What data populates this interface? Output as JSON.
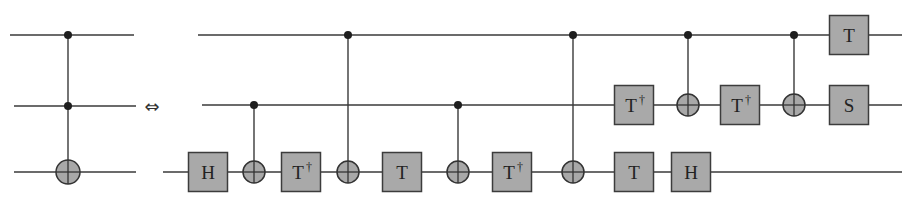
{
  "figure": {
    "equivalence_symbol": "⇔",
    "colors": {
      "gate_fill": "#a9a9a9",
      "wire": "#3a3a3a",
      "background": "#ffffff"
    }
  },
  "left_circuit": {
    "name": "Toffoli gate",
    "wires": [
      {
        "y": 35,
        "x1": 10,
        "x2": 134
      },
      {
        "y": 106,
        "x1": 14,
        "x2": 136
      },
      {
        "y": 172,
        "x1": 14,
        "x2": 136
      }
    ],
    "ops": [
      {
        "type": "ccnot",
        "x": 68,
        "controls": [
          0,
          1
        ],
        "target": 2
      }
    ]
  },
  "right_circuit": {
    "name": "Toffoli decomposition",
    "wires": [
      {
        "y": 35,
        "x1": 198,
        "x2": 902
      },
      {
        "y": 105,
        "x1": 202,
        "x2": 902
      },
      {
        "y": 172,
        "x1": 163,
        "x2": 902
      }
    ],
    "gates": [
      {
        "label": "H",
        "dagger": false,
        "x": 208,
        "wire": 2
      },
      {
        "label": "T",
        "dagger": true,
        "x": 301,
        "wire": 2
      },
      {
        "label": "T",
        "dagger": false,
        "x": 402,
        "wire": 2
      },
      {
        "label": "T",
        "dagger": true,
        "x": 512,
        "wire": 2
      },
      {
        "label": "T",
        "dagger": true,
        "x": 634,
        "wire": 1
      },
      {
        "label": "T",
        "dagger": false,
        "x": 634,
        "wire": 2
      },
      {
        "label": "H",
        "dagger": false,
        "x": 691,
        "wire": 2
      },
      {
        "label": "T",
        "dagger": true,
        "x": 740,
        "wire": 1
      },
      {
        "label": "T",
        "dagger": false,
        "x": 849,
        "wire": 0
      },
      {
        "label": "S",
        "dagger": false,
        "x": 849,
        "wire": 1
      }
    ],
    "cnots": [
      {
        "x": 254,
        "control": 1,
        "target": 2
      },
      {
        "x": 348,
        "control": 0,
        "target": 2
      },
      {
        "x": 458,
        "control": 1,
        "target": 2
      },
      {
        "x": 573,
        "control": 0,
        "target": 2
      },
      {
        "x": 688,
        "control": 0,
        "target": 1
      },
      {
        "x": 794,
        "control": 0,
        "target": 1
      }
    ]
  },
  "dagger_symbol": "†"
}
